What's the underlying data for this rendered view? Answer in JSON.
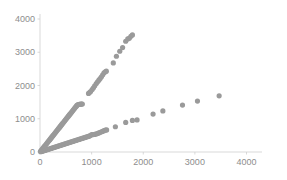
{
  "chart_data": {
    "type": "scatter",
    "title": "",
    "subtitle": "",
    "xlabel": "",
    "ylabel": "",
    "xlim": [
      0,
      4300
    ],
    "ylim": [
      0,
      4150
    ],
    "xticks": [
      0,
      1000,
      2000,
      3000,
      4000
    ],
    "yticks": [
      0,
      1000,
      2000,
      3000,
      4000
    ],
    "xticklabels": [
      "0",
      "1000",
      "2000",
      "3000",
      "4000"
    ],
    "yticklabels": [
      "0",
      "1000",
      "2000",
      "3000",
      "4000"
    ],
    "grid": false,
    "legend": null,
    "marker_color": "#9a9a9a",
    "marker_size": 2.6,
    "axis_color": "#cfcfcf",
    "tick_label_color": "#8d8d8d",
    "background": "#ffffff",
    "series": [
      {
        "name": "steep-series",
        "color": "#9a9a9a",
        "slope_approx": 1.96,
        "points": [
          [
            10,
            20
          ],
          [
            25,
            49
          ],
          [
            40,
            78
          ],
          [
            55,
            108
          ],
          [
            70,
            137
          ],
          [
            85,
            167
          ],
          [
            100,
            196
          ],
          [
            115,
            225
          ],
          [
            130,
            255
          ],
          [
            145,
            284
          ],
          [
            160,
            314
          ],
          [
            175,
            343
          ],
          [
            190,
            372
          ],
          [
            205,
            402
          ],
          [
            220,
            431
          ],
          [
            235,
            461
          ],
          [
            250,
            490
          ],
          [
            265,
            519
          ],
          [
            280,
            549
          ],
          [
            295,
            578
          ],
          [
            310,
            608
          ],
          [
            325,
            637
          ],
          [
            340,
            666
          ],
          [
            355,
            696
          ],
          [
            370,
            725
          ],
          [
            385,
            755
          ],
          [
            400,
            784
          ],
          [
            415,
            813
          ],
          [
            430,
            843
          ],
          [
            445,
            872
          ],
          [
            460,
            902
          ],
          [
            475,
            931
          ],
          [
            490,
            960
          ],
          [
            505,
            990
          ],
          [
            520,
            1019
          ],
          [
            535,
            1049
          ],
          [
            550,
            1078
          ],
          [
            565,
            1107
          ],
          [
            580,
            1137
          ],
          [
            595,
            1166
          ],
          [
            610,
            1196
          ],
          [
            625,
            1225
          ],
          [
            640,
            1254
          ],
          [
            655,
            1284
          ],
          [
            670,
            1313
          ],
          [
            685,
            1343
          ],
          [
            700,
            1372
          ],
          [
            715,
            1401
          ],
          [
            730,
            1420
          ],
          [
            745,
            1428
          ],
          [
            760,
            1432
          ],
          [
            775,
            1436
          ],
          [
            790,
            1439
          ],
          [
            805,
            1441
          ],
          [
            820,
            1443
          ],
          [
            940,
            1760
          ],
          [
            960,
            1790
          ],
          [
            980,
            1820
          ],
          [
            1010,
            1880
          ],
          [
            1035,
            1930
          ],
          [
            1060,
            1990
          ],
          [
            1090,
            2060
          ],
          [
            1115,
            2110
          ],
          [
            1140,
            2160
          ],
          [
            1165,
            2210
          ],
          [
            1190,
            2260
          ],
          [
            1215,
            2320
          ],
          [
            1240,
            2380
          ],
          [
            1265,
            2410
          ],
          [
            1285,
            2430
          ],
          [
            1420,
            2680
          ],
          [
            1480,
            2880
          ],
          [
            1545,
            3030
          ],
          [
            1600,
            3140
          ],
          [
            1660,
            3330
          ],
          [
            1700,
            3400
          ],
          [
            1730,
            3420
          ],
          [
            1760,
            3480
          ],
          [
            1790,
            3520
          ]
        ]
      },
      {
        "name": "shallow-series",
        "color": "#9a9a9a",
        "slope_approx": 0.5,
        "points": [
          [
            15,
            8
          ],
          [
            35,
            18
          ],
          [
            55,
            28
          ],
          [
            75,
            38
          ],
          [
            95,
            48
          ],
          [
            115,
            58
          ],
          [
            135,
            68
          ],
          [
            155,
            78
          ],
          [
            175,
            88
          ],
          [
            195,
            98
          ],
          [
            215,
            108
          ],
          [
            235,
            118
          ],
          [
            255,
            128
          ],
          [
            275,
            138
          ],
          [
            295,
            148
          ],
          [
            315,
            158
          ],
          [
            335,
            168
          ],
          [
            355,
            178
          ],
          [
            375,
            188
          ],
          [
            395,
            198
          ],
          [
            415,
            208
          ],
          [
            435,
            218
          ],
          [
            455,
            228
          ],
          [
            475,
            238
          ],
          [
            495,
            248
          ],
          [
            515,
            258
          ],
          [
            535,
            268
          ],
          [
            555,
            278
          ],
          [
            575,
            288
          ],
          [
            595,
            298
          ],
          [
            615,
            308
          ],
          [
            635,
            318
          ],
          [
            655,
            328
          ],
          [
            675,
            338
          ],
          [
            695,
            348
          ],
          [
            715,
            358
          ],
          [
            735,
            368
          ],
          [
            755,
            378
          ],
          [
            775,
            388
          ],
          [
            795,
            398
          ],
          [
            815,
            408
          ],
          [
            835,
            418
          ],
          [
            855,
            428
          ],
          [
            875,
            438
          ],
          [
            895,
            448
          ],
          [
            915,
            458
          ],
          [
            935,
            468
          ],
          [
            955,
            478
          ],
          [
            975,
            495
          ],
          [
            1000,
            520
          ],
          [
            1030,
            525
          ],
          [
            1060,
            530
          ],
          [
            1090,
            545
          ],
          [
            1120,
            560
          ],
          [
            1150,
            580
          ],
          [
            1180,
            600
          ],
          [
            1210,
            620
          ],
          [
            1240,
            640
          ],
          [
            1265,
            655
          ],
          [
            1290,
            665
          ],
          [
            1460,
            760
          ],
          [
            1660,
            890
          ],
          [
            1790,
            950
          ],
          [
            1880,
            965
          ],
          [
            2190,
            1140
          ],
          [
            2380,
            1235
          ],
          [
            2760,
            1410
          ],
          [
            3050,
            1530
          ],
          [
            3470,
            1690
          ]
        ]
      }
    ]
  }
}
